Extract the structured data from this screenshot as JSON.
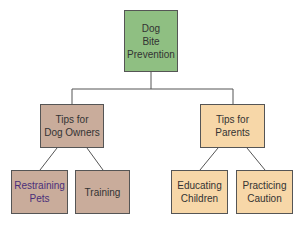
{
  "diagram": {
    "type": "tree",
    "root": {
      "label": "Dog\nBite\nPrevention",
      "color": "#8fbf82"
    },
    "branches": [
      {
        "label": "Tips for\nDog Owners",
        "color": "#c9ac9b",
        "children": [
          {
            "label": "Restraining\nPets",
            "text_color": "#4a2f7a"
          },
          {
            "label": "Training"
          }
        ]
      },
      {
        "label": "Tips for\nParents",
        "color": "#f7d7a8",
        "children": [
          {
            "label": "Educating\nChildren"
          },
          {
            "label": "Practicing\nCaution"
          }
        ]
      }
    ]
  },
  "labels": {
    "root_l1": "Dog",
    "root_l2": "Bite",
    "root_l3": "Prevention",
    "owners_l1": "Tips for",
    "owners_l2": "Dog Owners",
    "parents_l1": "Tips for",
    "parents_l2": "Parents",
    "restraining_l1": "Restraining",
    "restraining_l2": "Pets",
    "training": "Training",
    "educating_l1": "Educating",
    "educating_l2": "Children",
    "practicing_l1": "Practicing",
    "practicing_l2": "Caution"
  }
}
